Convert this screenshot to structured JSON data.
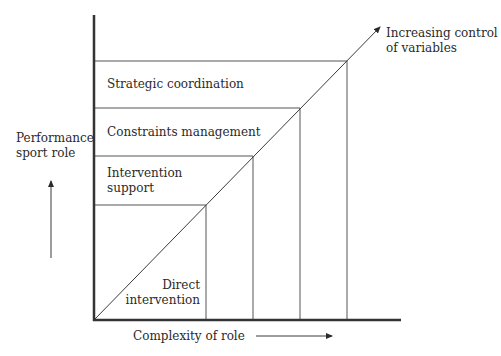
{
  "diagram": {
    "y_axis_label": [
      "Performance",
      "sport role"
    ],
    "x_axis_label": "Complexity of role",
    "diagonal_label": [
      "Increasing control",
      "of variables"
    ],
    "roles": [
      {
        "label": [
          "Strategic coordination"
        ]
      },
      {
        "label": [
          "Constraints management"
        ]
      },
      {
        "label": [
          "Intervention",
          "support"
        ]
      },
      {
        "label": [
          "Direct",
          "intervention"
        ]
      }
    ],
    "colors": {
      "line": "#3a3a3a",
      "text": "#2a2a2a",
      "background": "#ffffff"
    }
  }
}
